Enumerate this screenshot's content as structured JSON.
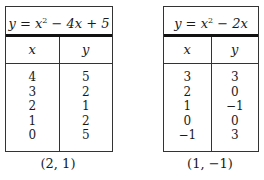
{
  "tables": [
    {
      "equation_prefix": "y = x",
      "equation_exp": "2",
      "equation_suffix": " − 4x + 5",
      "headers": {
        "x": "x",
        "y": "y"
      },
      "x_values": "4\n3\n2\n1\n0",
      "y_values": "5\n2\n1\n2\n5",
      "rows": [
        {
          "x": "4",
          "y": "5"
        },
        {
          "x": "3",
          "y": "2"
        },
        {
          "x": "2",
          "y": "1"
        },
        {
          "x": "1",
          "y": "2"
        },
        {
          "x": "0",
          "y": "5"
        }
      ],
      "vertex": "(2, 1)"
    },
    {
      "equation_prefix": "y = x",
      "equation_exp": "2",
      "equation_suffix": " − 2x",
      "headers": {
        "x": "x",
        "y": "y"
      },
      "rows": [
        {
          "x": "3",
          "y": "3"
        },
        {
          "x": "2",
          "y": "0"
        },
        {
          "x": "1",
          "y": "−1"
        },
        {
          "x": "0",
          "y": "0"
        },
        {
          "x": "−1",
          "y": "3"
        }
      ],
      "vertex": "(1, −1)"
    }
  ]
}
